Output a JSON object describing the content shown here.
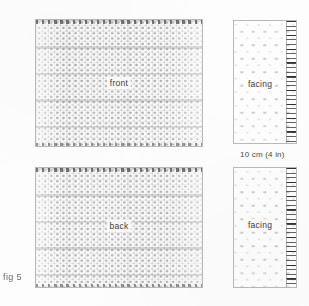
{
  "figure": {
    "caption": "fig 5",
    "scale_note": "10 cm (4 in)"
  },
  "panels": [
    {
      "id": "front-body",
      "label": "front",
      "kind": "body-swatch",
      "has_ruler": false
    },
    {
      "id": "front-facing",
      "label": "facing",
      "kind": "facing-swatch",
      "has_ruler": true
    },
    {
      "id": "back-body",
      "label": "back",
      "kind": "body-swatch",
      "has_ruler": false
    },
    {
      "id": "back-facing",
      "label": "facing",
      "kind": "facing-swatch",
      "has_ruler": true
    }
  ],
  "colors": {
    "page_background": "#fdfdfd",
    "panel_border": "#b9b9b9",
    "stitch_ink": "#5a5a5f",
    "label_text": "#3a3a3e",
    "caption_text": "#6a6a6e"
  }
}
